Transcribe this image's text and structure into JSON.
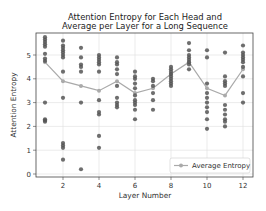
{
  "chart_data": {
    "type": "scatter",
    "title": "Attention Entropy for Each Head and Average per Layer for a Long Sequence",
    "title_lines": [
      "Attention Entropy for Each Head and",
      "Average per Layer for a Long Sequence"
    ],
    "xlabel": "Layer Number",
    "ylabel": "Attention Entropy",
    "xlim": [
      0.5,
      12.5
    ],
    "ylim": [
      -0.1,
      5.9
    ],
    "xticks": [
      2,
      4,
      6,
      8,
      10,
      12
    ],
    "yticks": [
      0,
      1,
      2,
      3,
      4,
      5
    ],
    "grid": true,
    "legend": {
      "position": "lower right",
      "entries": [
        "Average Entropy"
      ]
    },
    "colors": {
      "heads": "#555555",
      "average": "#aaaaaa",
      "grid": "#dddddd",
      "frame": "#444444"
    },
    "series": [
      {
        "name": "Head Entropy",
        "kind": "scatter",
        "points": [
          [
            1,
            5.75
          ],
          [
            1,
            5.65
          ],
          [
            1,
            5.55
          ],
          [
            1,
            5.45
          ],
          [
            1,
            5.35
          ],
          [
            1,
            5.05
          ],
          [
            1,
            4.85
          ],
          [
            1,
            4.75
          ],
          [
            1,
            3.0
          ],
          [
            1,
            2.3
          ],
          [
            1,
            2.25
          ],
          [
            1,
            2.2
          ],
          [
            2,
            5.6
          ],
          [
            2,
            5.4
          ],
          [
            2,
            5.3
          ],
          [
            2,
            5.2
          ],
          [
            2,
            5.1
          ],
          [
            2,
            5.0
          ],
          [
            2,
            4.9
          ],
          [
            2,
            4.3
          ],
          [
            2,
            3.2
          ],
          [
            2,
            1.3
          ],
          [
            2,
            1.2
          ],
          [
            2,
            1.1
          ],
          [
            2,
            0.6
          ],
          [
            3,
            5.3
          ],
          [
            3,
            4.9
          ],
          [
            3,
            4.6
          ],
          [
            3,
            4.5
          ],
          [
            3,
            4.3
          ],
          [
            3,
            3.0
          ],
          [
            3,
            0.2
          ],
          [
            4,
            5.0
          ],
          [
            4,
            4.9
          ],
          [
            4,
            4.8
          ],
          [
            4,
            4.7
          ],
          [
            4,
            4.6
          ],
          [
            4,
            4.3
          ],
          [
            4,
            3.1
          ],
          [
            4,
            2.6
          ],
          [
            4,
            2.5
          ],
          [
            4,
            1.6
          ],
          [
            4,
            1.1
          ],
          [
            5,
            4.9
          ],
          [
            5,
            4.7
          ],
          [
            5,
            4.6
          ],
          [
            5,
            4.4
          ],
          [
            5,
            4.2
          ],
          [
            5,
            3.7
          ],
          [
            5,
            3.2
          ],
          [
            5,
            3.0
          ],
          [
            5,
            2.9
          ],
          [
            5,
            2.8
          ],
          [
            6,
            4.3
          ],
          [
            6,
            4.1
          ],
          [
            6,
            4.0
          ],
          [
            6,
            3.8
          ],
          [
            6,
            3.6
          ],
          [
            6,
            3.3
          ],
          [
            6,
            3.1
          ],
          [
            6,
            3.0
          ],
          [
            6,
            2.9
          ],
          [
            6,
            2.7
          ],
          [
            6,
            2.3
          ],
          [
            7,
            4.0
          ],
          [
            7,
            3.9
          ],
          [
            7,
            3.7
          ],
          [
            7,
            3.4
          ],
          [
            7,
            3.1
          ],
          [
            7,
            2.7
          ],
          [
            8,
            4.5
          ],
          [
            8,
            4.4
          ],
          [
            8,
            4.3
          ],
          [
            8,
            4.2
          ],
          [
            8,
            4.1
          ],
          [
            8,
            4.0
          ],
          [
            8,
            3.9
          ],
          [
            8,
            3.8
          ],
          [
            8,
            3.7
          ],
          [
            9,
            5.5
          ],
          [
            9,
            5.2
          ],
          [
            9,
            5.0
          ],
          [
            9,
            4.9
          ],
          [
            9,
            4.8
          ],
          [
            9,
            4.7
          ],
          [
            9,
            4.6
          ],
          [
            9,
            4.4
          ],
          [
            10,
            5.2
          ],
          [
            10,
            4.9
          ],
          [
            10,
            3.8
          ],
          [
            10,
            3.4
          ],
          [
            10,
            3.2
          ],
          [
            10,
            3.0
          ],
          [
            10,
            2.8
          ],
          [
            10,
            2.6
          ],
          [
            10,
            2.3
          ],
          [
            10,
            1.9
          ],
          [
            11,
            5.1
          ],
          [
            11,
            4.1
          ],
          [
            11,
            3.9
          ],
          [
            11,
            3.8
          ],
          [
            11,
            3.7
          ],
          [
            11,
            2.9
          ],
          [
            11,
            2.7
          ],
          [
            11,
            2.5
          ],
          [
            11,
            2.3
          ],
          [
            11,
            2.2
          ],
          [
            11,
            2.0
          ],
          [
            12,
            5.4
          ],
          [
            12,
            5.1
          ],
          [
            12,
            5.0
          ],
          [
            12,
            4.9
          ],
          [
            12,
            4.8
          ],
          [
            12,
            4.7
          ],
          [
            12,
            4.5
          ],
          [
            12,
            4.1
          ],
          [
            12,
            3.4
          ],
          [
            12,
            3.0
          ]
        ]
      },
      {
        "name": "Average Entropy",
        "kind": "line",
        "x": [
          1,
          2,
          3,
          4,
          5,
          6,
          7,
          8,
          9,
          10,
          11,
          12
        ],
        "values": [
          4.7,
          3.9,
          3.7,
          3.5,
          3.9,
          3.4,
          3.6,
          4.2,
          4.7,
          3.6,
          3.3,
          4.4
        ]
      }
    ]
  }
}
